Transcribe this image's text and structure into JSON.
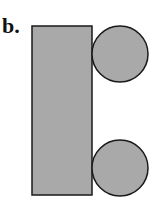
{
  "figure": {
    "label": "b.",
    "shapes": {
      "rectangle": {
        "x": 32,
        "y": 26,
        "width": 60,
        "height": 169
      },
      "top_circle": {
        "cx": 120,
        "cy": 54,
        "r": 28
      },
      "bottom_circle": {
        "cx": 120,
        "cy": 168,
        "r": 28
      }
    },
    "colors": {
      "fill": "#a9a9a9",
      "stroke": "#1a1a1a",
      "background": "#ffffff"
    }
  }
}
